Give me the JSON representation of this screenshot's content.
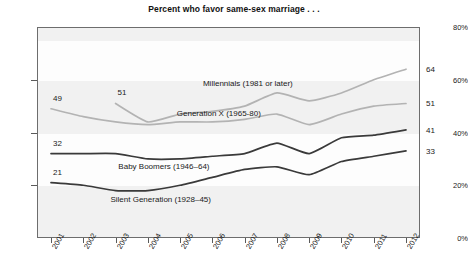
{
  "chart_data": {
    "type": "line",
    "title": "Percent who favor same-sex marriage . . .",
    "xlabel": "",
    "ylabel": "",
    "x": [
      2001,
      2002,
      2003,
      2004,
      2005,
      2006,
      2007,
      2008,
      2009,
      2010,
      2011,
      2012
    ],
    "xtick_labels": [
      "2001",
      "2002",
      "2003",
      "2004",
      "2005",
      "2006",
      "2007",
      "2008",
      "2009",
      "2010",
      "2011",
      "2012"
    ],
    "ytick_labels": [
      "0%",
      "20%",
      "40%",
      "60%",
      "80%"
    ],
    "ytick_values": [
      0,
      20,
      40,
      60,
      80
    ],
    "ylim": [
      0,
      80
    ],
    "grid": false,
    "legend_position": "inline-annotations",
    "series": [
      {
        "name": "Millennials (1981 or later)",
        "color": "#b3b3b3",
        "start_label": "51",
        "end_label": "64",
        "x": [
          2003,
          2004,
          2005,
          2006,
          2007,
          2008,
          2009,
          2010,
          2011,
          2012
        ],
        "values": [
          51,
          44,
          47,
          48,
          50,
          55,
          52,
          55,
          60,
          64
        ]
      },
      {
        "name": "Generation X (1965-80)",
        "color": "#b3b3b3",
        "start_label": "49",
        "end_label": "51",
        "x": [
          2001,
          2002,
          2003,
          2004,
          2005,
          2006,
          2007,
          2008,
          2009,
          2010,
          2011,
          2012
        ],
        "values": [
          49,
          46,
          44,
          43,
          44,
          44,
          45,
          47,
          43,
          47,
          50,
          51
        ]
      },
      {
        "name": "Baby Boomers (1946–64)",
        "color": "#3a3a3a",
        "start_label": "32",
        "end_label": "41",
        "x": [
          2001,
          2002,
          2003,
          2004,
          2005,
          2006,
          2007,
          2008,
          2009,
          2010,
          2011,
          2012
        ],
        "values": [
          32,
          32,
          32,
          30,
          30,
          31,
          32,
          36,
          32,
          38,
          39,
          41
        ]
      },
      {
        "name": "Silent Generation (1928–45)",
        "color": "#3a3a3a",
        "start_label": "21",
        "end_label": "33",
        "x": [
          2001,
          2002,
          2003,
          2004,
          2005,
          2006,
          2007,
          2008,
          2009,
          2010,
          2011,
          2012
        ],
        "values": [
          21,
          20,
          18,
          18,
          20,
          23,
          26,
          27,
          24,
          29,
          31,
          33
        ]
      }
    ],
    "annotations": [
      {
        "text": "Millennials (1981 or later)",
        "x": 2007.1,
        "y": 58.5
      },
      {
        "text": "Generation X (1965-80)",
        "x": 2006.2,
        "y": 47.0
      },
      {
        "text": "Baby Boomers (1946–64)",
        "x": 2004.5,
        "y": 27.0
      },
      {
        "text": "Silent Generation (1928–45)",
        "x": 2004.4,
        "y": 14.5
      }
    ]
  }
}
